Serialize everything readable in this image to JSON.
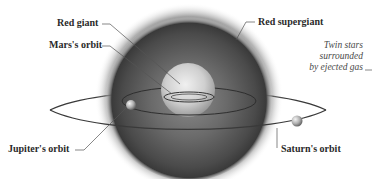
{
  "diagram": {
    "labels": {
      "red_giant": "Red giant",
      "mars_orbit": "Mars's orbit",
      "red_supergiant": "Red supergiant",
      "jupiter_orbit": "Jupiter's orbit",
      "saturn_orbit": "Saturn's orbit"
    },
    "note": {
      "lines": [
        "Twin stars",
        "surrounded",
        "by ejected gas"
      ]
    },
    "colors": {
      "background": "#ffffff",
      "supergiant_edge": "#3c3c3c",
      "supergiant_core": "#707070",
      "red_giant": "#d8d8d8",
      "orbit_line": "#3a3a3a",
      "leader_line": "#555555",
      "label_text": "#2a2a2a"
    }
  }
}
